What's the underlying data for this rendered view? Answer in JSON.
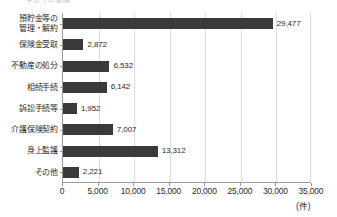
{
  "caption": {
    "partial_text": "申立ての動機"
  },
  "chart_data": {
    "type": "bar",
    "orientation": "horizontal",
    "title": "",
    "subtitle": "",
    "xlabel": "(件)",
    "ylabel": "",
    "categories": [
      "預貯金等の\n管理・解約",
      "保険金受取",
      "不動産の処分",
      "相続手続",
      "訴訟手続等",
      "介護保険契約",
      "身上監護",
      "その他"
    ],
    "values": [
      29477,
      2872,
      6532,
      6142,
      1952,
      7007,
      13312,
      2221
    ],
    "value_labels": [
      "29,477",
      "2,872",
      "6,532",
      "6,142",
      "1,952",
      "7,007",
      "13,312",
      "2,221"
    ],
    "xlim": [
      0,
      35000
    ],
    "xticks": [
      0,
      5000,
      10000,
      15000,
      20000,
      25000,
      30000,
      35000
    ],
    "xtick_labels": [
      "0",
      "5,000",
      "10,000",
      "15,000",
      "20,000",
      "25,000",
      "30,000",
      "35,000"
    ],
    "unit": "(件)",
    "grid": true,
    "grid_axis": "x",
    "legend": false,
    "colors": {
      "bar": "#3a3a3a",
      "grid": "#dcdcdc",
      "axis": "#9b9b9b",
      "text": "#2b2b2b",
      "background": "#ffffff"
    }
  }
}
